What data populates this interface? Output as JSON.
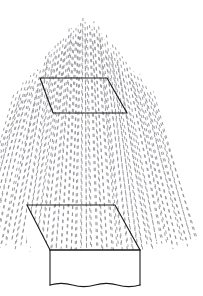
{
  "figure": {
    "background_color": "#ffffff",
    "width": 203,
    "height": 296,
    "annotation": {
      "label_value": "1",
      "label_unit": "m",
      "label_exponent": "2",
      "label_full": "1 m²",
      "label_x": 128,
      "label_y": 93,
      "leader_start_x": 126,
      "leader_start_y": 89,
      "leader_end_x": 92,
      "leader_end_y": 99,
      "arrow_tip_x": 90,
      "arrow_tip_y": 100
    },
    "area_patch": {
      "name": "one-square-metre-patch",
      "shape": "parallelogram",
      "points": "40,78 107,78 127,113 53,113",
      "stroke_color": "#1a1a1a",
      "fill": "none"
    },
    "collector_box": {
      "name": "rain-collector-box",
      "top_face_points": "27,205 115,205 140,250 50,250",
      "front_face_points": "50,250 140,250 140,285 50,285",
      "left_face_points": "27,205 50,250 50,285 27,242",
      "bottom_wave_baseline_y": 285,
      "stroke_color": "#1a1a1a",
      "face_fill": "#ffffff"
    },
    "rain_field": {
      "name": "rain-streaks",
      "streak_color": "#8d8d92",
      "streak_width": 0.85,
      "dash_pattern": "3.2 3.6",
      "origin_x": 84,
      "origin_y": -150,
      "column_count": 46,
      "top_y_center": 18,
      "top_y_edge": 96,
      "bottom_y": 252,
      "spread_half_width": 118
    },
    "colors": {
      "ink": "#1a1a1a",
      "rain": "#8d8d92",
      "paper": "#ffffff"
    }
  }
}
